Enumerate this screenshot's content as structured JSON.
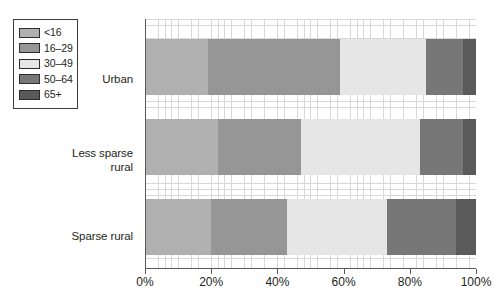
{
  "chart_data": {
    "type": "bar",
    "orientation": "horizontal",
    "stacked": true,
    "normalized_percent": true,
    "title": "",
    "subtitle": "",
    "xlabel": "",
    "ylabel": "",
    "xlim": [
      0,
      100
    ],
    "xticks": [
      0,
      20,
      40,
      60,
      80,
      100
    ],
    "xticklabels": [
      "0%",
      "20%",
      "40%",
      "60%",
      "80%",
      "100%"
    ],
    "grid": true,
    "grid_style": "fine cross-hatch graph paper",
    "legend_position": "top-left outside",
    "categories": [
      "Urban",
      "Less sparse rural",
      "Sparse rural"
    ],
    "category_labels_multiline": [
      [
        "Urban"
      ],
      [
        "Less sparse",
        "rural"
      ],
      [
        "Sparse rural"
      ]
    ],
    "series": [
      {
        "name": "<16",
        "color": "#b0b0b0",
        "values": [
          19,
          22,
          20
        ]
      },
      {
        "name": "16–29",
        "color": "#969696",
        "values": [
          40,
          25,
          23
        ]
      },
      {
        "name": "30–49",
        "color": "#e6e6e6",
        "values": [
          26,
          36,
          30
        ]
      },
      {
        "name": "50–64",
        "color": "#777777",
        "values": [
          11,
          13,
          21
        ]
      },
      {
        "name": "65+",
        "color": "#5a5a5a",
        "values": [
          4,
          4,
          6
        ]
      }
    ]
  },
  "legend": {
    "items": [
      {
        "label": "<16",
        "color": "#b0b0b0"
      },
      {
        "label": "16–29",
        "color": "#969696"
      },
      {
        "label": "30–49",
        "color": "#e6e6e6"
      },
      {
        "label": "50–64",
        "color": "#777777"
      },
      {
        "label": "65+",
        "color": "#5a5a5a"
      }
    ]
  },
  "axis": {
    "tick_labels": [
      "0%",
      "20%",
      "40%",
      "60%",
      "80%",
      "100%"
    ]
  },
  "categories_display": {
    "urban": "Urban",
    "less_sparse_rural_line1": "Less sparse",
    "less_sparse_rural_line2": "rural",
    "sparse_rural": "Sparse rural"
  },
  "colors": {
    "axis": "#58595b",
    "grid": "#d8d8d8",
    "text": "#231f20",
    "legend_border": "#3b3b3b"
  }
}
